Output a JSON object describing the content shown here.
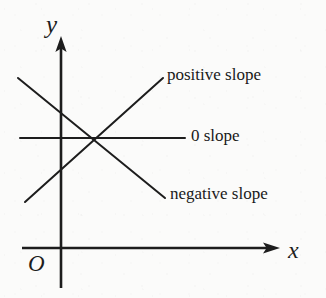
{
  "figure": {
    "background_color": "#fbfbfa",
    "ink_color": "#1d1d1d"
  },
  "axes": {
    "y_axis": {
      "name": "y-axis",
      "label": "y",
      "arrow": "up"
    },
    "x_axis": {
      "name": "x-axis",
      "label": "x",
      "arrow": "right"
    },
    "origin": {
      "label": "O"
    }
  },
  "labels": {
    "positive": "positive slope",
    "zero": "0 slope",
    "negative": "negative slope"
  },
  "chart_data": {
    "type": "line",
    "xlabel": "x",
    "ylabel": "y",
    "grid": false,
    "legend": "inline-right",
    "annotations": [
      "positive slope",
      "0 slope",
      "negative slope",
      "O",
      "x",
      "y"
    ],
    "series": [
      {
        "name": "positive slope",
        "label": "positive slope",
        "slope": "positive",
        "x": [
          25,
          163
        ],
        "y": [
          202,
          78
        ]
      },
      {
        "name": "0 slope",
        "label": "0 slope",
        "slope": "zero",
        "x": [
          20,
          185
        ],
        "y": [
          138,
          138
        ]
      },
      {
        "name": "negative slope",
        "label": "negative slope",
        "slope": "negative",
        "x": [
          18,
          165
        ],
        "y": [
          78,
          198
        ]
      }
    ],
    "intersection": {
      "x": 95,
      "y": 138
    }
  }
}
